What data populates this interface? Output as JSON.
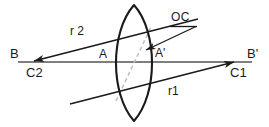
{
  "figure": {
    "width": 269,
    "height": 127,
    "background_color": "#ffffff",
    "stroke_color": "#1a1a1a",
    "axis_color": "#4d4d4d",
    "dashed_color": "#b3b3b3"
  },
  "labels": {
    "b_left": "B",
    "b_right": "B'",
    "c2": "C2",
    "c1": "C1",
    "a": "A",
    "a_prime": "A'",
    "r2": "r 2",
    "r1": "r1",
    "oc": "OC"
  },
  "geometry": {
    "lens": {
      "name": "biconvex-lens",
      "top_apex": [
        134,
        5
      ],
      "bottom_apex": [
        134,
        121
      ],
      "left_surface_bulge_x": 112,
      "right_surface_bulge_x": 156
    },
    "optical_axis": {
      "name": "optical-axis",
      "from": [
        18,
        62
      ],
      "to": [
        252,
        62
      ]
    },
    "ray_r2": {
      "name": "ray-r2",
      "from": [
        196,
        20
      ],
      "to": [
        32,
        62
      ],
      "arrow_at": "to"
    },
    "ray_r1": {
      "name": "ray-r1",
      "from": [
        72,
        103
      ],
      "to": [
        236,
        62
      ],
      "arrow_at": "to"
    },
    "dashed_center_line": {
      "name": "dashed-center-line",
      "from": [
        116,
        100
      ],
      "to": [
        150,
        28
      ]
    },
    "oc_leader": {
      "name": "oc-callout-leader",
      "from": [
        196,
        27
      ],
      "to": [
        143,
        52
      ],
      "arrow_at": "to",
      "underline_from": [
        170,
        27
      ],
      "underline_to": [
        197,
        27
      ]
    }
  }
}
